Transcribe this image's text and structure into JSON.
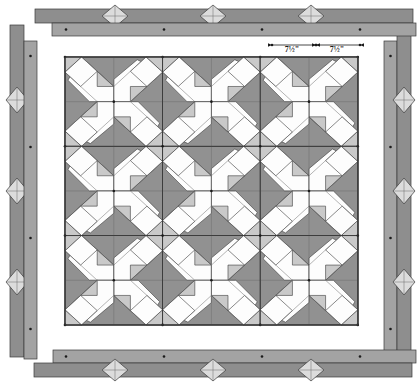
{
  "diagram": {
    "type": "quilt-construction-schematic",
    "canvas": {
      "width": 420,
      "height": 384,
      "background": "#ffffff"
    }
  },
  "colors": {
    "background": "#ffffff",
    "block_ground": "#919191",
    "border_strip_dark": "#8e8e8e",
    "border_strip_light": "#a3a3a3",
    "patch_white": "#fdfdfd",
    "patch_light_gray": "#c9c9c9",
    "diamond_fill": "#dcdcdc",
    "outline": "#3a3a3a",
    "seam_line": "#6a6a6a",
    "dot_marker": "#1a1a1a",
    "dimension_line": "#1b1b1b",
    "label_text": "#1b1b1b"
  },
  "quilt_body": {
    "label": "quilt-center-3x3-blocks",
    "x": 65,
    "y": 57,
    "width": 293,
    "height": 268,
    "rows": 3,
    "cols": 3,
    "block_count": 9,
    "block_width": 97.6,
    "block_height": 89.3,
    "block_name": "pinwheel-star-block"
  },
  "dimensions": [
    {
      "name": "dimension-left",
      "value": "7½\"",
      "x1": 272,
      "x2": 316,
      "y": 45,
      "label_x": 292,
      "label_y": 52
    },
    {
      "name": "dimension-right",
      "value": "7½\"",
      "x1": 316,
      "x2": 360,
      "y": 45,
      "label_x": 337,
      "label_y": 52
    }
  ],
  "borders": {
    "top": [
      {
        "name": "border-strip-top-outer",
        "x": 35,
        "y": 9,
        "width": 378,
        "height": 14,
        "fill": "#8e8e8e",
        "diamonds": [
          115,
          213,
          311
        ]
      },
      {
        "name": "border-strip-top-inner",
        "x": 52,
        "y": 23,
        "width": 364,
        "height": 13,
        "fill": "#a3a3a3",
        "dots": [
          66,
          164,
          262,
          360
        ]
      }
    ],
    "bottom": [
      {
        "name": "border-strip-bottom-inner",
        "x": 53,
        "y": 350,
        "width": 363,
        "height": 13,
        "fill": "#a3a3a3",
        "dots": [
          66,
          164,
          262,
          360
        ]
      },
      {
        "name": "border-strip-bottom-outer",
        "x": 34,
        "y": 363,
        "width": 378,
        "height": 14,
        "fill": "#8e8e8e",
        "diamonds": [
          115,
          213,
          311
        ]
      }
    ],
    "left": [
      {
        "name": "border-strip-left-outer",
        "x": 10,
        "y": 25,
        "width": 14,
        "height": 332,
        "fill": "#8e8e8e",
        "diamonds": [
          100,
          191,
          282
        ]
      },
      {
        "name": "border-strip-left-inner",
        "x": 24,
        "y": 41,
        "width": 13,
        "height": 318,
        "fill": "#a3a3a3",
        "dots": [
          56,
          147,
          238,
          329
        ]
      }
    ],
    "right": [
      {
        "name": "border-strip-right-inner",
        "x": 384,
        "y": 41,
        "width": 13,
        "height": 318,
        "fill": "#a3a3a3",
        "dots": [
          56,
          147,
          238,
          329
        ]
      },
      {
        "name": "border-strip-right-outer",
        "x": 397,
        "y": 25,
        "width": 14,
        "height": 332,
        "fill": "#8e8e8e",
        "diamonds": [
          100,
          191,
          282
        ]
      }
    ]
  },
  "markers": {
    "dot_radius": 1.3,
    "diamond_radius_x": 13,
    "diamond_radius_y": 13
  }
}
